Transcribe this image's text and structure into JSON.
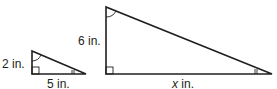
{
  "figure": {
    "small_triangle": {
      "height_label": "2 in.",
      "base_label": "5 in."
    },
    "large_triangle": {
      "height_label": "6 in.",
      "base_label_var": "x",
      "base_label_unit": " in."
    },
    "stroke_color": "#231f20"
  }
}
